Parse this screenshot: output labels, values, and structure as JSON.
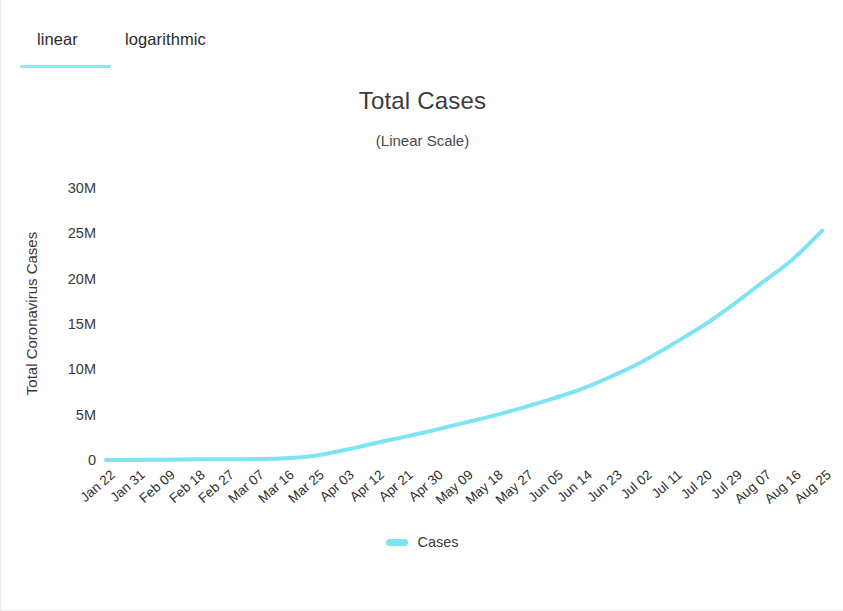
{
  "tabs": {
    "items": [
      {
        "id": "linear",
        "label": "linear",
        "active": true
      },
      {
        "id": "logarithmic",
        "label": "logarithmic",
        "active": false
      }
    ],
    "active_indicator_color": "#8ee6f3"
  },
  "chart_data": {
    "type": "line",
    "title": "Total Cases",
    "subtitle": "(Linear Scale)",
    "xlabel": "",
    "ylabel": "Total Coronavirus Cases",
    "grid": false,
    "legend_position": "bottom",
    "series_color": "#7ce4f2",
    "ylim": [
      0,
      32000000
    ],
    "ytick_values": [
      0,
      5000000,
      10000000,
      15000000,
      20000000,
      25000000,
      30000000
    ],
    "ytick_labels": [
      "0",
      "5M",
      "10M",
      "15M",
      "20M",
      "25M",
      "30M"
    ],
    "categories": [
      "Jan 22",
      "Jan 31",
      "Feb 09",
      "Feb 18",
      "Feb 27",
      "Mar 07",
      "Mar 16",
      "Mar 25",
      "Apr 03",
      "Apr 12",
      "Apr 21",
      "Apr 30",
      "May 09",
      "May 18",
      "May 27",
      "Jun 05",
      "Jun 14",
      "Jun 23",
      "Jul 02",
      "Jul 11",
      "Jul 20",
      "Jul 29",
      "Aug 07",
      "Aug 16",
      "Aug 25"
    ],
    "series": [
      {
        "name": "Cases",
        "color": "#7ce4f2",
        "values": [
          555,
          11950,
          40553,
          75204,
          82756,
          106100,
          182400,
          468000,
          1095000,
          1850000,
          2550000,
          3300000,
          4100000,
          4900000,
          5800000,
          6800000,
          7900000,
          9300000,
          10900000,
          12800000,
          14800000,
          17100000,
          19600000,
          22100000,
          25300000
        ]
      }
    ],
    "legend": [
      {
        "label": "Cases",
        "color": "#7ce4f2"
      }
    ]
  }
}
